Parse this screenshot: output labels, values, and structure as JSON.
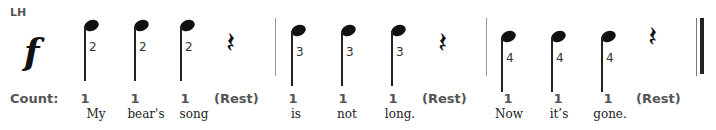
{
  "hand_label": "LH",
  "dynamic": "f",
  "count_label": "Count:",
  "measures": [
    {
      "beats": [
        {
          "type": "quarter-note",
          "finger": "2",
          "count": "1",
          "lyric": "My"
        },
        {
          "type": "quarter-note",
          "finger": "2",
          "count": "1",
          "lyric": "bear's"
        },
        {
          "type": "quarter-note",
          "finger": "2",
          "count": "1",
          "lyric": "song"
        },
        {
          "type": "quarter-rest",
          "count": "(Rest)",
          "lyric": ""
        }
      ]
    },
    {
      "beats": [
        {
          "type": "quarter-note",
          "finger": "3",
          "count": "1",
          "lyric": "is"
        },
        {
          "type": "quarter-note",
          "finger": "3",
          "count": "1",
          "lyric": "not"
        },
        {
          "type": "quarter-note",
          "finger": "3",
          "count": "1",
          "lyric": "long."
        },
        {
          "type": "quarter-rest",
          "count": "(Rest)",
          "lyric": ""
        }
      ]
    },
    {
      "beats": [
        {
          "type": "quarter-note",
          "finger": "4",
          "count": "1",
          "lyric": "Now"
        },
        {
          "type": "quarter-note",
          "finger": "4",
          "count": "1",
          "lyric": "it’s"
        },
        {
          "type": "quarter-note",
          "finger": "4",
          "count": "1",
          "lyric": "gone."
        },
        {
          "type": "quarter-rest",
          "count": "(Rest)",
          "lyric": ""
        }
      ]
    }
  ],
  "rest_glyph": "𝄽"
}
